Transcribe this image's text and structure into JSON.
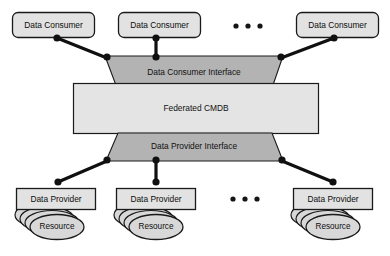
{
  "diagram": {
    "colors": {
      "node_fill": "#e2e2e2",
      "interface_fill": "#b3b3b3",
      "core_fill": "#e4e4e4",
      "resource_fill": "#d8d8d8",
      "stroke": "#1a1a1a",
      "connector": "#101010",
      "background": "#ffffff"
    },
    "consumers": [
      {
        "label": "Data Consumer"
      },
      {
        "label": "Data Consumer"
      },
      {
        "label": "Data Consumer"
      }
    ],
    "consumer_ellipsis": "• • •",
    "consumer_interface": {
      "label": "Data Consumer Interface"
    },
    "core": {
      "label": "Federated CMDB"
    },
    "provider_interface": {
      "label": "Data Provider Interface"
    },
    "providers": [
      {
        "label": "Data Provider",
        "resource_label": "Resource"
      },
      {
        "label": "Data Provider",
        "resource_label": "Resource"
      },
      {
        "label": "Data Provider",
        "resource_label": "Resource"
      }
    ],
    "provider_ellipsis": "• • •"
  }
}
